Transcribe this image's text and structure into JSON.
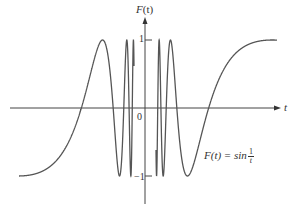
{
  "chart_data": {
    "type": "line",
    "title": "",
    "function": "F(t) = sin(1/t)",
    "xlabel": "t",
    "ylabel": "F(t)",
    "ylim": [
      -1,
      1
    ],
    "xlim": [
      -0.63,
      0.66
    ],
    "grid": false,
    "legend": null,
    "y_ticks": [
      {
        "value": 1,
        "label": "1"
      },
      {
        "value": -1,
        "label": "-1"
      }
    ],
    "origin_label": "0",
    "annotation": {
      "text": "F(t) = sin 1/t",
      "position": "lower right of curve"
    },
    "series": [
      {
        "name": "F(t)=sin(1/t)",
        "color": "#555555"
      }
    ]
  },
  "labels": {
    "y_axis": {
      "main": "F",
      "arg": "(t)"
    },
    "x_axis": "t",
    "origin": "0",
    "tick_pos": "1",
    "tick_neg": "−1",
    "formula_lhs": "F(t) = sin",
    "formula_num": "1",
    "formula_den": "t"
  },
  "style": {
    "curve_color": "#555555",
    "axis_color": "#444444"
  }
}
